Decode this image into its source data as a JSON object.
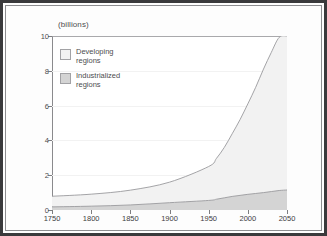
{
  "figure": {
    "title": "(billions)",
    "frame_color": "#3a3a3c",
    "plot_bg": "#ffffff"
  },
  "legend": {
    "items": [
      {
        "label_line1": "Developing",
        "label_line2": "regions",
        "color": "#f2f2f2",
        "name": "developing-regions"
      },
      {
        "label_line1": "Industrialized",
        "label_line2": "regions",
        "color": "#d4d4d4",
        "name": "industrialized-regions"
      }
    ]
  },
  "axes": {
    "y_ticks": [
      "0",
      "2",
      "4",
      "6",
      "8",
      "10"
    ],
    "x_ticks": [
      "1750",
      "1800",
      "1850",
      "1900",
      "1950",
      "2000",
      "2050"
    ]
  },
  "chart_data": {
    "type": "area",
    "stacked": true,
    "title": "(billions)",
    "xlabel": "",
    "ylabel": "(billions)",
    "xlim": [
      1750,
      2050
    ],
    "ylim": [
      0,
      10
    ],
    "grid": true,
    "legend_position": "inside-top-left",
    "units": "billions of people",
    "x": [
      1750,
      1800,
      1850,
      1900,
      1950,
      1960,
      1970,
      1980,
      1990,
      2000,
      2010,
      2020,
      2030,
      2040,
      2050
    ],
    "series": [
      {
        "name": "Industrialized regions",
        "color": "#d4d4d4",
        "line_color": "#9a9a9d",
        "values": [
          0.18,
          0.22,
          0.29,
          0.42,
          0.55,
          0.62,
          0.7,
          0.78,
          0.84,
          0.9,
          0.95,
          1.0,
          1.06,
          1.12,
          1.15
        ]
      },
      {
        "name": "Developing regions",
        "color": "#f2f2f2",
        "line_color": "#9a9a9d",
        "values": [
          0.61,
          0.69,
          0.85,
          1.18,
          1.95,
          2.35,
          2.9,
          3.6,
          4.35,
          5.2,
          6.1,
          7.1,
          8.0,
          8.8,
          8.85
        ]
      }
    ],
    "totals": [
      0.79,
      0.91,
      1.14,
      1.6,
      2.5,
      2.97,
      3.6,
      4.38,
      5.19,
      6.1,
      7.05,
      8.1,
      9.06,
      9.92,
      10.0
    ],
    "annotations": []
  }
}
